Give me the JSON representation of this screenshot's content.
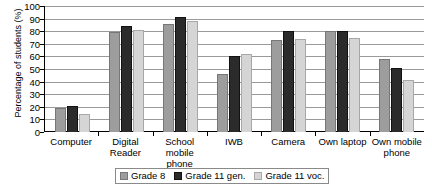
{
  "chart_data": {
    "type": "bar",
    "title": "",
    "subtitle": "",
    "xlabel": "",
    "ylabel": "Percentage of students (%)",
    "ylim": [
      0,
      100
    ],
    "ytick_step": 10,
    "yticks": [
      100,
      90,
      80,
      70,
      60,
      50,
      40,
      30,
      20,
      10,
      0
    ],
    "grid": true,
    "grid_axis": "y",
    "legend_position": "bottom-center",
    "categories": [
      "Computer",
      "Digital Reader",
      "School mobile phone",
      "IWB",
      "Camera",
      "Own laptop",
      "Own mobile phone"
    ],
    "series": [
      {
        "name": "Grade 8",
        "color": "#9d9d9d",
        "values": [
          19,
          79,
          86,
          46,
          73,
          80,
          58
        ]
      },
      {
        "name": "Grade 11 gen.",
        "color": "#2b2b2b",
        "values": [
          21,
          84,
          91,
          60,
          80,
          80,
          51
        ]
      },
      {
        "name": "Grade 11 voc.",
        "color": "#d5d5d5",
        "values": [
          14,
          81,
          88,
          62,
          74,
          75,
          41
        ]
      }
    ]
  },
  "axis": {
    "y_title": "Percentage of students (%)"
  }
}
